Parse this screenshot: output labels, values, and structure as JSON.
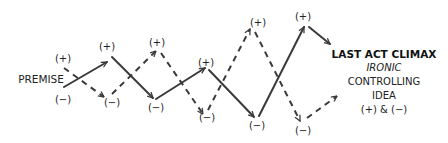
{
  "diagram": {
    "start_label": "PREMISE",
    "start_plus": "(+)",
    "start_minus": "(−)",
    "ending": {
      "title": "LAST ACT CLIMAX",
      "line2": "IRONIC",
      "line3": "CONTROLLING",
      "line4": "IDEA",
      "line5": "(+) & (−)"
    },
    "solid_path_labels": [
      "(+)",
      "(−)",
      "(+)",
      "(−)",
      "(+)"
    ],
    "dashed_path_labels": [
      "(−)",
      "(+)",
      "(−)",
      "(+)",
      "(−)"
    ],
    "colors": {
      "line": "#3a3a3a",
      "text": "#222222"
    }
  }
}
